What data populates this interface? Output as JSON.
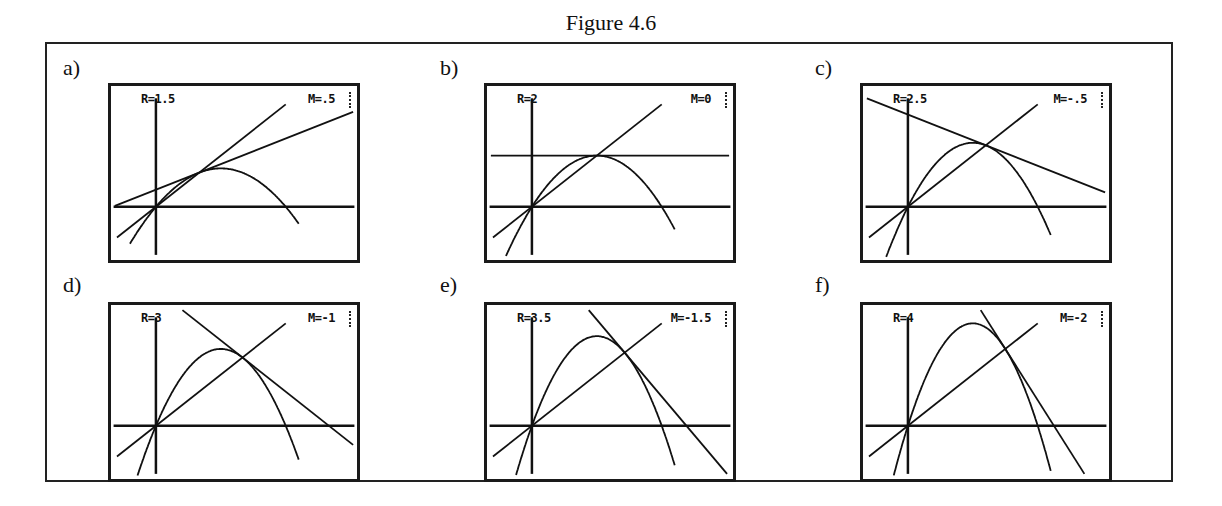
{
  "figure": {
    "title": "Figure 4.6"
  },
  "window": {
    "xmin": -0.346,
    "xmax": 1.549,
    "ymin": -0.519,
    "ymax": 1.179
  },
  "panels": [
    {
      "label": "a)",
      "r_text": "R=1.5",
      "m_text": "M=.5",
      "R": 1.5,
      "M": 0.5
    },
    {
      "label": "b)",
      "r_text": "R=2",
      "m_text": "M=0",
      "R": 2,
      "M": 0
    },
    {
      "label": "c)",
      "r_text": "R=2.5",
      "m_text": "M=-.5",
      "R": 2.5,
      "M": -0.5
    },
    {
      "label": "d)",
      "r_text": "R=3",
      "m_text": "M=-1",
      "R": 3,
      "M": -1
    },
    {
      "label": "e)",
      "r_text": "R=3.5",
      "m_text": "M=-1.5",
      "R": 3.5,
      "M": -1.5
    },
    {
      "label": "f)",
      "r_text": "R=4",
      "m_text": "M=-2",
      "R": 4,
      "M": -2
    }
  ],
  "chart_data": {
    "type": "line",
    "title": "Figure 4.6",
    "xlabel": "",
    "ylabel": "",
    "xlim": [
      -0.346,
      1.549
    ],
    "ylim": [
      -0.519,
      1.179
    ],
    "grid": false,
    "series": [
      {
        "name": "a) R=1.5, M=.5",
        "R": 1.5,
        "fixed_point": [
          0.333,
          0.333
        ],
        "tangent_slope": 0.5
      },
      {
        "name": "b) R=2, M=0",
        "R": 2,
        "fixed_point": [
          0.5,
          0.5
        ],
        "tangent_slope": 0
      },
      {
        "name": "c) R=2.5, M=-.5",
        "R": 2.5,
        "fixed_point": [
          0.6,
          0.6
        ],
        "tangent_slope": -0.5
      },
      {
        "name": "d) R=3, M=-1",
        "R": 3,
        "fixed_point": [
          0.667,
          0.667
        ],
        "tangent_slope": -1
      },
      {
        "name": "e) R=3.5, M=-1.5",
        "R": 3.5,
        "fixed_point": [
          0.714,
          0.714
        ],
        "tangent_slope": -1.5
      },
      {
        "name": "f) R=4, M=-2",
        "R": 4,
        "fixed_point": [
          0.75,
          0.75
        ],
        "tangent_slope": -2
      }
    ]
  }
}
